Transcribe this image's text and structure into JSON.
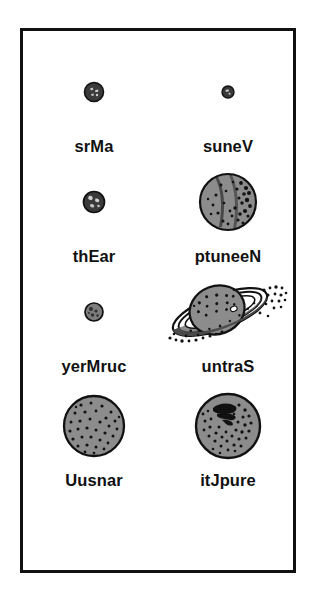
{
  "poster": {
    "background_color": "#ffffff",
    "border_color": "#111111",
    "planet_fill": "#8c8c8c",
    "planet_dark_fill": "#3a3a3a",
    "outline_color": "#111111",
    "text_color": "#111111"
  },
  "planets": [
    {
      "label": "srMa",
      "icon": "mars-planet-icon",
      "size": "small",
      "row": 0,
      "column": 0,
      "shade": "dark",
      "has_rings": false,
      "diameter_px": 17
    },
    {
      "label": "suneV",
      "icon": "venus-planet-icon",
      "size": "tiny",
      "row": 0,
      "column": 1,
      "shade": "dark",
      "has_rings": false,
      "diameter_px": 11
    },
    {
      "label": "thEar",
      "icon": "earth-planet-icon",
      "size": "small",
      "row": 1,
      "column": 0,
      "shade": "dark",
      "has_rings": false,
      "diameter_px": 19
    },
    {
      "label": "ptuneeN",
      "icon": "neptune-planet-icon",
      "size": "large",
      "row": 1,
      "column": 1,
      "shade": "light",
      "has_rings": false,
      "diameter_px": 58
    },
    {
      "label": "yerMruc",
      "icon": "mercury-planet-icon",
      "size": "small",
      "row": 2,
      "column": 0,
      "shade": "medium",
      "has_rings": false,
      "diameter_px": 17
    },
    {
      "label": "untraS",
      "icon": "saturn-planet-icon",
      "size": "large",
      "row": 2,
      "column": 1,
      "shade": "light",
      "has_rings": true,
      "diameter_px": 56
    },
    {
      "label": "Uusnar",
      "icon": "uranus-planet-icon",
      "size": "large",
      "row": 3,
      "column": 0,
      "shade": "light",
      "has_rings": false,
      "diameter_px": 62
    },
    {
      "label": "itJpure",
      "icon": "jupiter-planet-icon",
      "size": "large",
      "row": 3,
      "column": 1,
      "shade": "light",
      "has_rings": false,
      "diameter_px": 66
    }
  ]
}
